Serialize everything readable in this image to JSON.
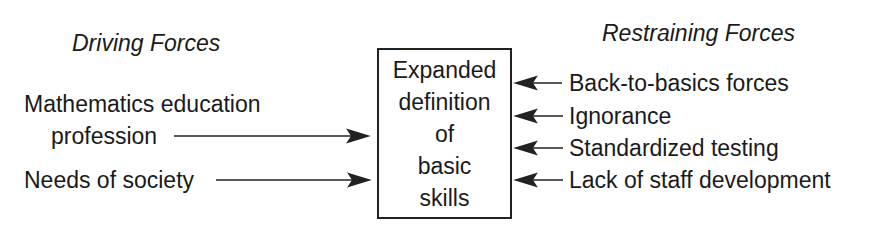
{
  "diagram": {
    "type": "force-field-analysis",
    "center": {
      "lines": [
        "Expanded",
        "definition",
        "of",
        "basic",
        "skills"
      ]
    },
    "driving": {
      "heading": "Driving Forces",
      "items": [
        {
          "label_line1": "Mathematics education",
          "label_line2": "profession"
        },
        {
          "label": "Needs of society"
        }
      ]
    },
    "restraining": {
      "heading": "Restraining Forces",
      "items": [
        {
          "label": "Back-to-basics forces"
        },
        {
          "label": "Ignorance"
        },
        {
          "label": "Standardized testing"
        },
        {
          "label": "Lack of staff development"
        }
      ]
    },
    "colors": {
      "ink": "#1a1a1a",
      "background": "#ffffff"
    }
  }
}
